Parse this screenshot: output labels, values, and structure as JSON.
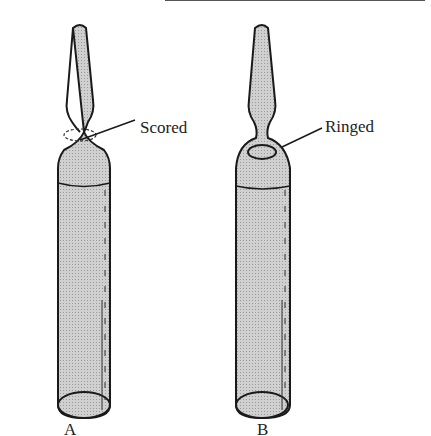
{
  "figure": {
    "ampules": [
      {
        "id": "A",
        "label": "A",
        "annotation": "Scored"
      },
      {
        "id": "B",
        "label": "B",
        "annotation": "Ringed"
      }
    ]
  },
  "colors": {
    "fill": "#c8c8c8",
    "stroke": "#1a1a1a"
  }
}
